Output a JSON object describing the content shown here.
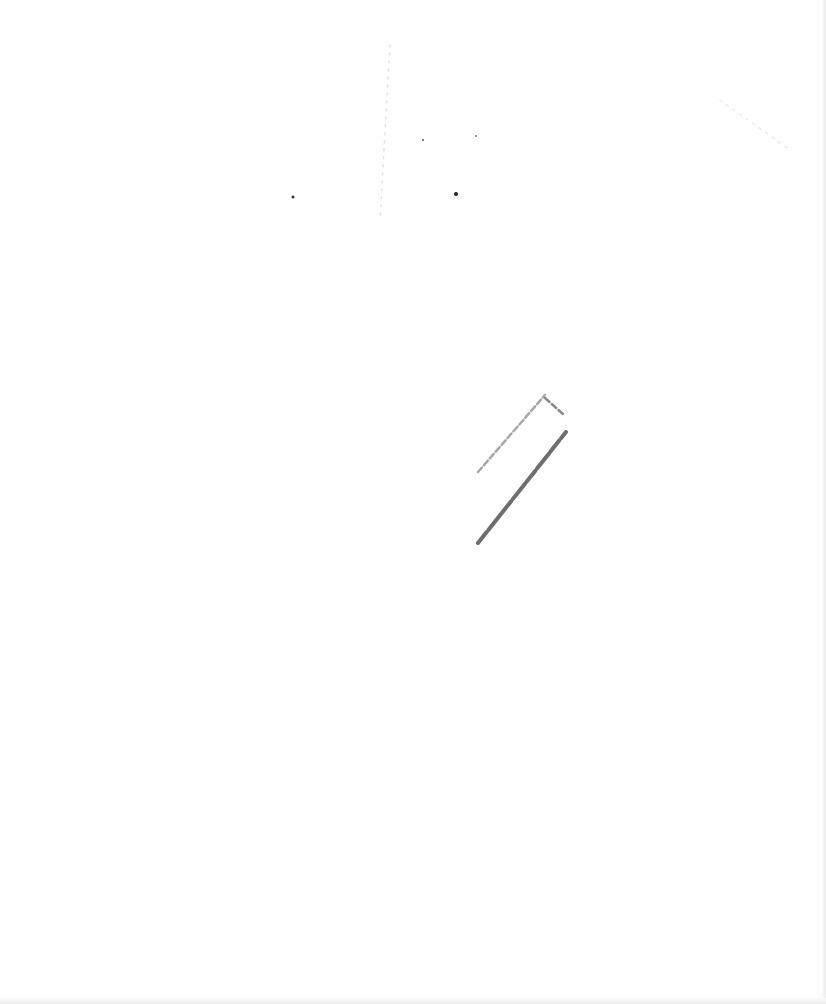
{
  "page": {
    "type": "blank scanned page",
    "background_color": "#fefefe",
    "marks": [
      {
        "name": "pencil-stroke-light",
        "x1": 478,
        "y1": 472,
        "x2": 545,
        "y2": 395,
        "color": "#9a9a9a"
      },
      {
        "name": "pencil-stroke-dark",
        "x1": 478,
        "y1": 543,
        "x2": 566,
        "y2": 432,
        "color": "#555555"
      },
      {
        "name": "pencil-tick",
        "x1": 545,
        "y1": 398,
        "x2": 563,
        "y2": 414,
        "color": "#777777"
      },
      {
        "name": "faint-dotted-line",
        "x1": 390,
        "y1": 45,
        "x2": 380,
        "y2": 220,
        "color": "#d0d0d0"
      },
      {
        "name": "faint-speckle-diagonal",
        "x1": 720,
        "y1": 100,
        "x2": 790,
        "y2": 150,
        "color": "#dddddd"
      }
    ],
    "dots": [
      {
        "x": 293,
        "y": 197,
        "r": 1.5,
        "color": "#333333"
      },
      {
        "x": 456,
        "y": 194,
        "r": 2,
        "color": "#222222"
      },
      {
        "x": 423,
        "y": 140,
        "r": 1,
        "color": "#555555"
      },
      {
        "x": 476,
        "y": 136,
        "r": 1,
        "color": "#777777"
      }
    ]
  }
}
